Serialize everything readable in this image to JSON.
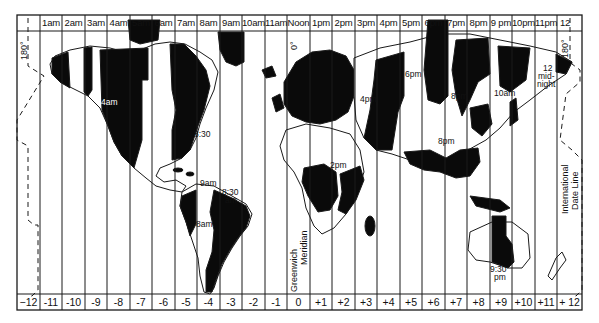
{
  "map": {
    "title": "World Time Zones",
    "header_row": {
      "first_cell": "",
      "labels": [
        "1am",
        "2am",
        "3am",
        "4am",
        "5am",
        "6am",
        "7am",
        "8am",
        "9am",
        "10am",
        "11am",
        "Noon",
        "1pm",
        "2pm",
        "3pm",
        "4pm",
        "5pm",
        "6pm",
        "7pm",
        "8pm",
        "9 pm",
        "10pm",
        "11pm",
        "12"
      ]
    },
    "footer_row": {
      "labels": [
        "−12",
        "-11",
        "-10",
        "-9",
        "-8",
        "-7",
        "-6",
        "-5",
        "-4",
        "-3",
        "-2",
        "-1",
        "0",
        "+1",
        "+2",
        "+3",
        "+4",
        "+5",
        "+6",
        "+7",
        "+8",
        "+9",
        "+10",
        "+11",
        "+ 12"
      ]
    },
    "meridian_labels": {
      "left_180": "180°",
      "zero": "0°",
      "right_180": "180°"
    },
    "line_labels": {
      "greenwich_1": "Greenwich",
      "greenwich_2": "Meridian",
      "idl_1": "International",
      "idl_2": "Date Line"
    },
    "region_labels": [
      {
        "text": "4am",
        "x": 107,
        "y": 100
      },
      {
        "text": "8:30",
        "x": 200,
        "y": 131
      },
      {
        "text": "9am",
        "x": 205,
        "y": 179
      },
      {
        "text": "8:30",
        "x": 228,
        "y": 188
      },
      {
        "text": "am",
        "x": 230,
        "y": 196
      },
      {
        "text": "8am",
        "x": 201,
        "y": 222
      },
      {
        "text": "2pm",
        "x": 336,
        "y": 163
      },
      {
        "text": "4pm",
        "x": 365,
        "y": 96
      },
      {
        "text": "6pm",
        "x": 410,
        "y": 72
      },
      {
        "text": "8pm",
        "x": 456,
        "y": 93
      },
      {
        "text": "10am",
        "x": 498,
        "y": 90
      },
      {
        "text": "12",
        "x": 545,
        "y": 66
      },
      {
        "text": "mid-",
        "x": 543,
        "y": 74
      },
      {
        "text": "night",
        "x": 542,
        "y": 82
      },
      {
        "text": "8pm",
        "x": 444,
        "y": 139
      },
      {
        "text": "9:30",
        "x": 493,
        "y": 267
      },
      {
        "text": "pm",
        "x": 496,
        "y": 275
      }
    ],
    "colors": {
      "land_shaded": "#0a0a0a",
      "land_unshaded": "#ffffff",
      "lines": "#1a1a1a",
      "background": "#ffffff"
    }
  }
}
